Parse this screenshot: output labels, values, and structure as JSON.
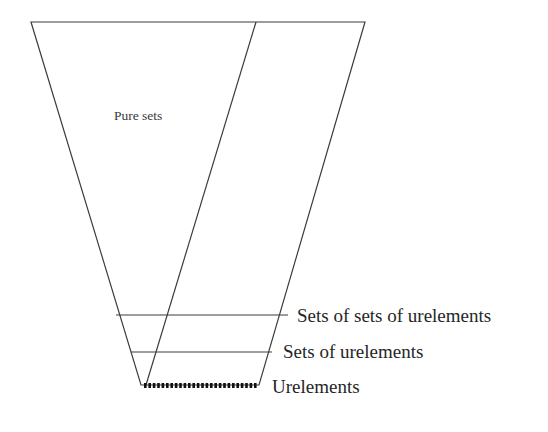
{
  "figure": {
    "title_text": "Pure sets",
    "background_color": "#ffffff",
    "stroke_color": "#3c3c3c",
    "labels": {
      "pure_sets": "Pure sets",
      "sets_of_sets_of_urelements": "Sets of sets of urelements",
      "sets_of_urelements": "Sets of urelements",
      "urelements": "Urelements"
    },
    "geometry": {
      "outer_top_left": [
        31,
        22
      ],
      "outer_top_right": [
        365,
        22
      ],
      "outer_bottom_left": [
        141,
        385
      ],
      "outer_bottom_right": [
        259,
        385
      ],
      "inner_diagonal_top": [
        256,
        22
      ],
      "inner_diagonal_bottom": [
        146,
        385
      ],
      "divider_1_y": 315,
      "divider_1_x": [
        116,
        288
      ],
      "divider_2_y": 352,
      "divider_2_x": [
        131,
        272
      ],
      "dotted_base_y": 385,
      "dotted_base_x": [
        144,
        258
      ]
    }
  }
}
